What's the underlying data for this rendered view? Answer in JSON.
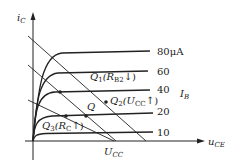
{
  "diagram": {
    "type": "transistor-output-characteristics",
    "axes": {
      "y_label_main": "i",
      "y_label_sub": "C",
      "x_label_main": "u",
      "x_label_sub": "CE"
    },
    "curves": [
      {
        "label": "80μA",
        "plateau_y": 52
      },
      {
        "label": "60",
        "plateau_y": 73
      },
      {
        "label": "40",
        "plateau_y": 92
      },
      {
        "label": "20",
        "plateau_y": 116
      },
      {
        "label": "10",
        "plateau_y": 133
      }
    ],
    "family_label_main": "I",
    "family_label_sub": "B",
    "ucc_label_main": "U",
    "ucc_label_sub": "CC",
    "points": {
      "q": {
        "label": "Q"
      },
      "q1": {
        "label_main": "Q",
        "label_num": "1",
        "label_paren": "(R",
        "label_sub": "B2",
        "label_arrow": "↓",
        "label_close": ")"
      },
      "q2": {
        "label_main": "Q",
        "label_num": "2",
        "label_paren": "(U",
        "label_sub": "CC",
        "label_arrow": "↑",
        "label_close": ")"
      },
      "q3": {
        "label_main": "Q",
        "label_num": "3",
        "label_paren": "(R",
        "label_sub": "C",
        "label_arrow": "↑",
        "label_close": ")"
      }
    },
    "colors": {
      "ink": "#222222",
      "background": "#ffffff"
    }
  }
}
